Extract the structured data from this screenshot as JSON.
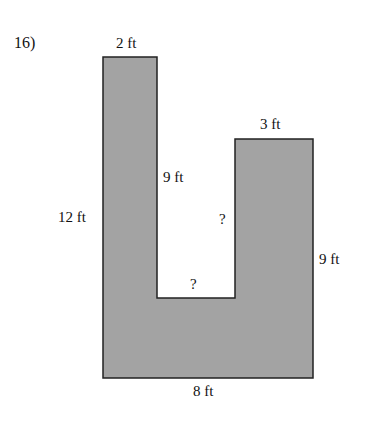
{
  "problem": {
    "number": "16)"
  },
  "figure": {
    "fill_color": "#a3a3a3",
    "stroke_color": "#222222",
    "unit": "ft",
    "polygon_points": "103,57 157,57 157,298 235,298 235,139 313,139 313,378 103,378",
    "labels": {
      "top_left_width": "2 ft",
      "inner_left_height": "9 ft",
      "outer_left_height": "12 ft",
      "inner_right_height_unknown": "?",
      "notch_width_unknown": "?",
      "top_right_width": "3 ft",
      "outer_right_height": "9 ft",
      "bottom_width": "8 ft"
    }
  }
}
